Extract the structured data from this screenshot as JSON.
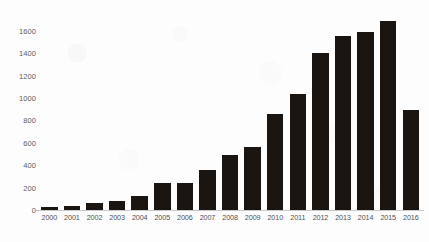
{
  "chart_data": {
    "type": "bar",
    "title": "",
    "subtitle": "",
    "xlabel": "",
    "ylabel": "",
    "categories": [
      "2000",
      "2001",
      "2002",
      "2003",
      "2004",
      "2005",
      "2006",
      "2007",
      "2008",
      "2009",
      "2010",
      "2011",
      "2012",
      "2013",
      "2014",
      "2015",
      "2016"
    ],
    "values": [
      25,
      40,
      60,
      80,
      125,
      240,
      240,
      360,
      490,
      560,
      860,
      1040,
      1400,
      1550,
      1590,
      1690,
      890
    ],
    "series": [
      {
        "name": "",
        "values": [
          25,
          40,
          60,
          80,
          125,
          240,
          240,
          360,
          490,
          560,
          860,
          1040,
          1400,
          1550,
          1590,
          1690,
          890
        ]
      }
    ],
    "ylim": [
      0,
      1750
    ],
    "y_ticks": [
      0,
      200,
      400,
      600,
      800,
      1000,
      1200,
      1400,
      1600
    ],
    "y_tick_labels": [
      "0",
      "200",
      "400",
      "600",
      "800",
      "1000",
      "1200",
      "1400",
      "1600"
    ],
    "grid": false,
    "legend": false,
    "legend_position": "none",
    "bar_color": "#1b1511",
    "axis_color": "#c9c9c9",
    "tick_label_color": "#4f4f4f",
    "background_color": "#fdfdfd"
  }
}
